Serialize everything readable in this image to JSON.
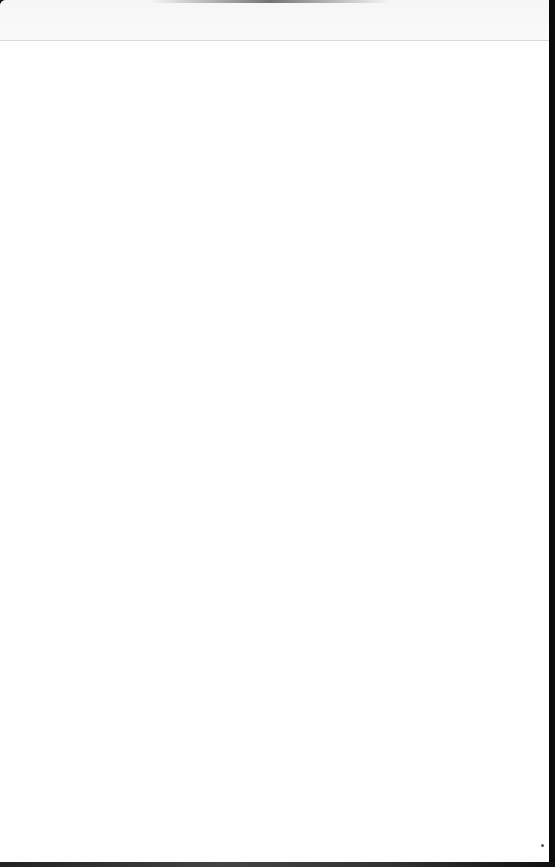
{
  "page": {
    "header_strip": {
      "text": ""
    },
    "body": {
      "text": ""
    }
  },
  "colors": {
    "paper": "#fdfdfd",
    "divider": "#d9d9d9",
    "edge": "#0a0a0a"
  }
}
